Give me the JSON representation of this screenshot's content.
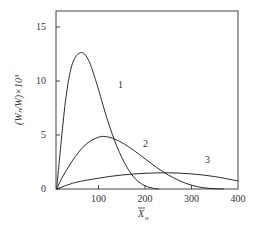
{
  "chart_data": {
    "type": "line",
    "title": "",
    "xlabel": "X̄n",
    "ylabel": "(Wn/W)×10³",
    "xlim": [
      0,
      400
    ],
    "ylim": [
      0,
      16.5
    ],
    "xticks": [
      100,
      200,
      300,
      400
    ],
    "yticks": [
      0,
      5,
      10,
      15
    ],
    "grid": false,
    "legend": "inline curve labels",
    "series": [
      {
        "name": "1",
        "x": [
          10,
          20,
          30,
          40,
          50,
          60,
          65,
          70,
          80,
          90,
          100,
          120,
          140,
          160,
          180,
          200,
          220,
          230
        ],
        "values": [
          0,
          4.5,
          8.5,
          11.0,
          12.2,
          12.6,
          12.6,
          12.5,
          11.8,
          10.6,
          9.2,
          6.3,
          3.9,
          2.1,
          0.9,
          0.3,
          0.05,
          0
        ]
      },
      {
        "name": "2",
        "x": [
          10,
          25,
          50,
          75,
          100,
          115,
          130,
          150,
          175,
          200,
          225,
          250,
          275,
          300,
          325,
          350,
          370
        ],
        "values": [
          0,
          1.3,
          3.0,
          4.2,
          4.8,
          4.85,
          4.7,
          4.3,
          3.6,
          2.8,
          2.0,
          1.3,
          0.75,
          0.35,
          0.12,
          0.03,
          0
        ]
      },
      {
        "name": "3",
        "x": [
          10,
          50,
          100,
          150,
          200,
          250,
          300,
          350,
          400
        ],
        "values": [
          0,
          0.6,
          1.0,
          1.3,
          1.45,
          1.5,
          1.4,
          1.15,
          0.75
        ]
      }
    ],
    "annotations": [
      {
        "text": "1",
        "x": 145,
        "y": 9.5
      },
      {
        "text": "2",
        "x": 180,
        "y": 3.3
      },
      {
        "text": "3",
        "x": 340,
        "y": 2.0
      }
    ]
  },
  "labels": {
    "y_ticks": [
      "0",
      "5",
      "10",
      "15"
    ],
    "x_ticks": [
      "100",
      "200",
      "300",
      "400"
    ],
    "curve_1": "1",
    "curve_2": "2",
    "curve_3": "3",
    "xlabel_main": "X",
    "xlabel_sub": "n",
    "ylabel": "(Wₙ/W)×10³"
  }
}
